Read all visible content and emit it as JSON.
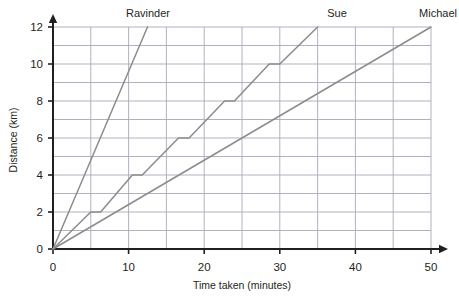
{
  "chart_data": {
    "type": "line",
    "title": "",
    "xlabel": "Time taken (minutes)",
    "ylabel": "Distance (km)",
    "xlim": [
      0,
      50
    ],
    "ylim": [
      0,
      12
    ],
    "x_ticks": [
      0,
      10,
      20,
      30,
      40,
      50
    ],
    "x_tick_labels": [
      "0",
      "10",
      "20",
      "30",
      "40",
      "50"
    ],
    "x_minor_step": 5,
    "y_ticks": [
      0,
      2,
      4,
      6,
      8,
      10,
      12
    ],
    "y_tick_labels": [
      "0",
      "2",
      "4",
      "6",
      "8",
      "10",
      "12"
    ],
    "y_minor_step": 1,
    "grid": true,
    "legend": "inline-end-labels",
    "series": [
      {
        "name": "Ravinder",
        "label": "Ravinder",
        "color": "#8c8c8c",
        "points": [
          [
            0,
            0
          ],
          [
            12.5,
            12
          ]
        ]
      },
      {
        "name": "Sue",
        "label": "Sue",
        "color": "#8c8c8c",
        "points": [
          [
            0,
            0
          ],
          [
            5,
            2
          ],
          [
            6.3,
            2
          ],
          [
            10.5,
            4
          ],
          [
            11.8,
            4
          ],
          [
            16.6,
            6
          ],
          [
            18,
            6
          ],
          [
            22.7,
            8
          ],
          [
            24,
            8
          ],
          [
            28.6,
            10
          ],
          [
            30,
            10
          ],
          [
            35,
            12
          ]
        ]
      },
      {
        "name": "Michael",
        "label": "Michael",
        "color": "#8c8c8c",
        "points": [
          [
            0,
            0
          ],
          [
            50,
            12
          ]
        ]
      }
    ],
    "series_label_positions": [
      {
        "name": "Ravinder",
        "x_px": 148,
        "y_px": 17
      },
      {
        "name": "Sue",
        "x_px": 337,
        "y_px": 17
      },
      {
        "name": "Michael",
        "x_px": 438,
        "y_px": 17
      }
    ],
    "colors": {
      "grid": "#a9a8ba",
      "axis": "#231f20",
      "line": "#8c8c8c",
      "text": "#231f20",
      "background": "#ffffff"
    }
  }
}
